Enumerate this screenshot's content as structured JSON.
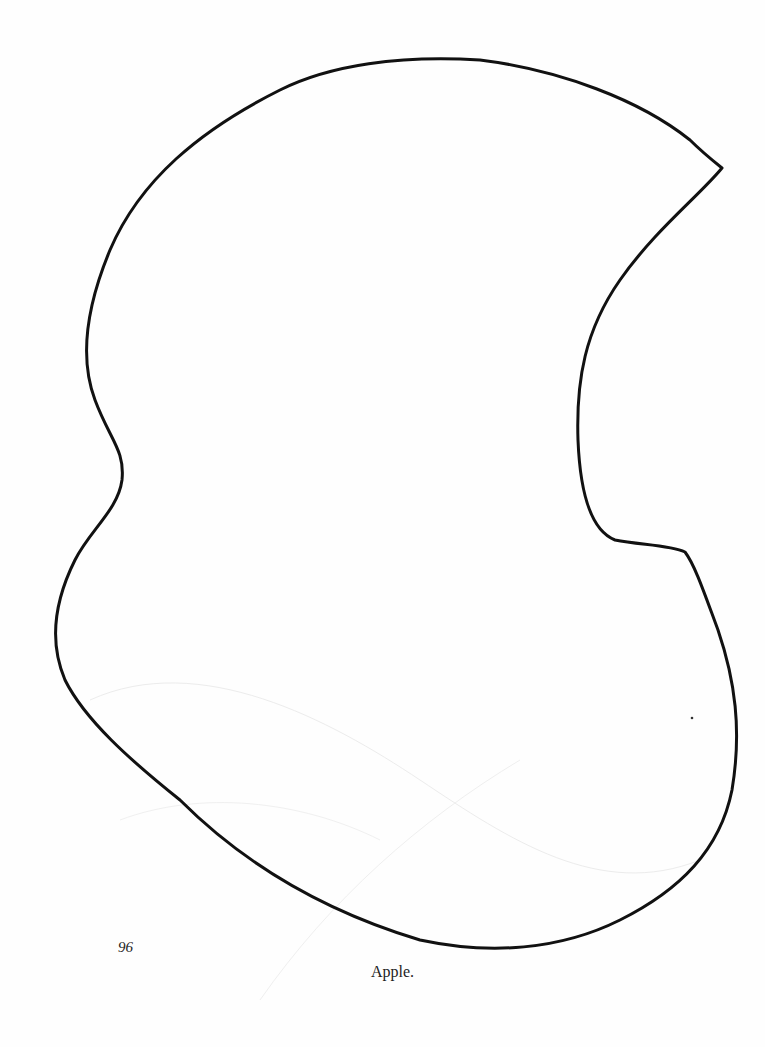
{
  "page": {
    "number": "96",
    "caption": "Apple.",
    "figure": {
      "type": "outline-shape",
      "subject": "apple",
      "stroke_color": "#111111",
      "background": "#ffffff"
    }
  }
}
